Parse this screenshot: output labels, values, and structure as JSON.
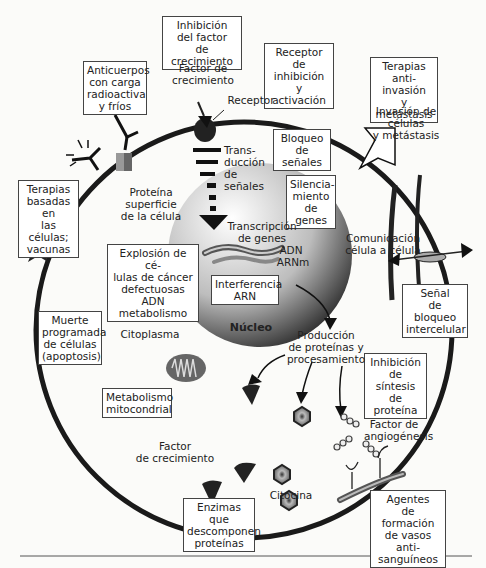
{
  "diagram": {
    "type": "cancer-cell-therapy-targets",
    "colors": {
      "membrane": "#1a1a1a",
      "background": "#fbfbf9",
      "box_border": "#444444"
    },
    "boxes": {
      "inhibicion_factor": "Inhibición\ndel factor\nde crecimiento",
      "anticuerpos": "Anticuerpos\ncon carga\nradioactiva\ny fríos",
      "receptor_inhibicion": "Receptor\nde inhibición\ny activación",
      "terapias_anti_invasion": "Terapias\nanti-invasión\ny metástasis",
      "bloqueo_senales": "Bloqueo\nde señales",
      "terapias_celulas": "Terapias\nbasadas en\nlas células;\nvacunas",
      "silenciamiento": "Silencia-\nmiento\nde genes",
      "explosion": "Explosión de cé-\nlulas de cáncer\ndefectuosas ADN\nmetabolismo",
      "interferencia": "Interferencia\nARN",
      "senal_bloqueo": "Señal\nde bloqueo\nintercelular",
      "muerte": "Muerte\nprogramada\nde células\n(apoptosis)",
      "inhibicion_sintesis": "Inhibición\nde síntesis\nde proteína",
      "metabolismo": "Metabolismo\nmitocondrial",
      "enzimas": "Enzimas que\ndescomponen\nproteínas",
      "agentes": "Agentes\nde formación\nde vasos anti-\nsanguíneos"
    },
    "labels": {
      "factor_crecimiento_top": "Factor de\ncrecimiento",
      "receptor": "Receptor",
      "invasion": "Invasión de células\ny metástasis",
      "transduccion": "Trans-\nducción\nde señales",
      "proteina_superficie": "Proteína\nsuperficie\nde la célula",
      "transcripcion": "Transcripción\nde genes",
      "adn": "ADN",
      "arnm": "ARNm",
      "comunicacion": "Comunicación\ncélula a célula",
      "nucleo": "Núcleo",
      "citoplasma": "Citoplasma",
      "produccion": "Producción\nde proteínas y\nprocesamiento",
      "factor_angiogenesis": "Factor de\nangiogénesis",
      "factor_crecimiento_bottom": "Factor\nde crecimiento",
      "citocina": "Citocina"
    }
  }
}
